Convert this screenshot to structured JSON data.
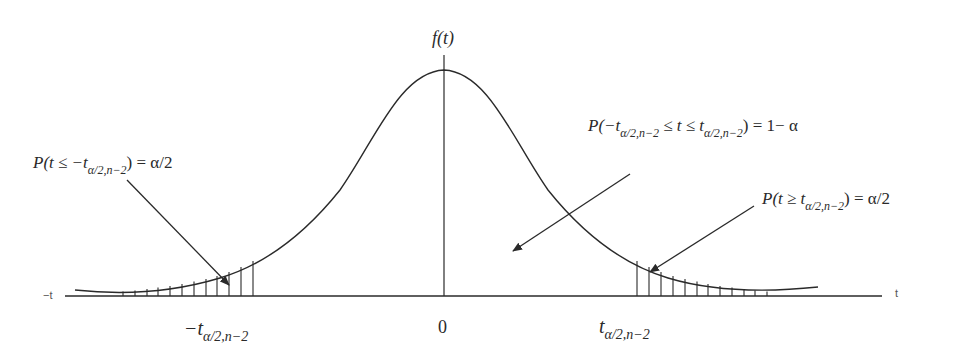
{
  "figure": {
    "type": "t-distribution two-tailed rejection region diagram",
    "y_axis_label": "f(t)",
    "x_axis": {
      "left_end_label": "−t",
      "right_end_label": "t",
      "tick_labels": {
        "left": {
          "main": "−t",
          "sub": "α/2,n−2"
        },
        "center": "0",
        "right": {
          "main": "t",
          "sub": "α/2,n−2"
        }
      }
    },
    "annotations": {
      "left_tail": {
        "prefix": "P(t ≤ −t",
        "sub": "α/2,n−2",
        "suffix": ") = α/2"
      },
      "center": {
        "prefix": "P(−t",
        "sub1": "α/2,n−2",
        "middle": " ≤ t ≤ t",
        "sub2": "α/2,n−2",
        "suffix": ") = 1− α"
      },
      "right_tail": {
        "prefix": "P(t ≥ t",
        "sub": "α/2,n−2",
        "suffix": ") = α/2"
      }
    },
    "shading": "vertical hatch lines in both tails",
    "colors": {
      "ink": "#2a2a2a",
      "background": "#ffffff"
    }
  }
}
